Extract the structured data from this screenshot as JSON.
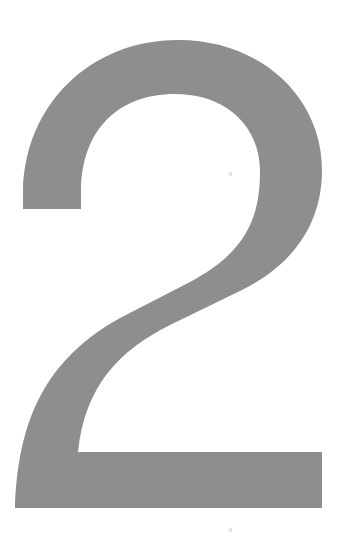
{
  "figure": {
    "glyph": "2",
    "colors": {
      "background": "#ffffff",
      "glyph_fill": "#8e8e8e",
      "speck": "#e2e2e2"
    }
  }
}
